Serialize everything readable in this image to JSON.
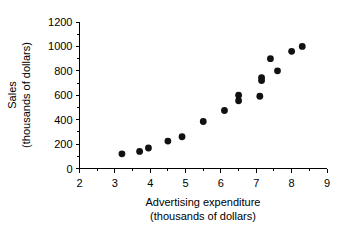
{
  "chart_data": {
    "type": "scatter",
    "title": "",
    "xlabel": "Advertising expenditure",
    "xlabel_units": "(thousands of dollars)",
    "ylabel": "Sales",
    "ylabel_units": "(thousands of dollars)",
    "xlim": [
      2,
      9
    ],
    "ylim": [
      0,
      1200
    ],
    "grid": false,
    "legend": "none",
    "x_ticks": [
      2,
      3,
      4,
      5,
      6,
      7,
      8,
      9
    ],
    "x_tick_labels": [
      "2",
      "3",
      "4",
      "5",
      "6",
      "7",
      "8",
      "9"
    ],
    "x_minor_step": 0.5,
    "y_ticks": [
      0,
      200,
      400,
      600,
      800,
      1000,
      1200
    ],
    "y_tick_labels": [
      "0",
      "200",
      "400",
      "600",
      "800",
      "1000",
      "1200"
    ],
    "y_minor_step": 100,
    "marker": "filled-circle",
    "marker_color": "#111111",
    "marker_size_px": 4.4,
    "x": [
      3.2,
      3.7,
      3.95,
      4.5,
      4.9,
      5.5,
      6.1,
      6.5,
      6.5,
      7.1,
      7.15,
      7.15,
      7.4,
      7.6,
      8.0,
      8.3
    ],
    "y": [
      120,
      140,
      168,
      225,
      260,
      385,
      475,
      555,
      600,
      592,
      720,
      745,
      900,
      800,
      960,
      1000
    ],
    "points": [
      {
        "x": 3.2,
        "y": 120
      },
      {
        "x": 3.7,
        "y": 140
      },
      {
        "x": 3.95,
        "y": 168
      },
      {
        "x": 4.5,
        "y": 225
      },
      {
        "x": 4.9,
        "y": 260
      },
      {
        "x": 5.5,
        "y": 385
      },
      {
        "x": 6.1,
        "y": 475
      },
      {
        "x": 6.5,
        "y": 555
      },
      {
        "x": 6.5,
        "y": 600
      },
      {
        "x": 7.1,
        "y": 592
      },
      {
        "x": 7.15,
        "y": 720
      },
      {
        "x": 7.15,
        "y": 745
      },
      {
        "x": 7.4,
        "y": 900
      },
      {
        "x": 7.6,
        "y": 800
      },
      {
        "x": 8.0,
        "y": 960
      },
      {
        "x": 8.3,
        "y": 1000
      }
    ]
  },
  "axes": {
    "x_title_line1": "Advertising expenditure",
    "x_title_line2": "(thousands of dollars)",
    "y_title_line1": "Sales",
    "y_title_line2": "(thousands of dollars)"
  }
}
